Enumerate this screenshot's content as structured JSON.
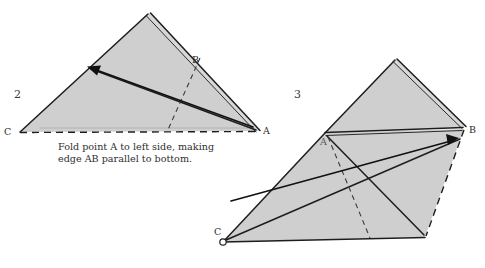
{
  "page": {
    "background_color": "#ffffff",
    "paper_fill_color": "#cfcfcf",
    "line_color": "#1d1d1d"
  },
  "figures": [
    {
      "step_number": "2",
      "caption_line_1": "Fold point A to left side, making",
      "caption_line_2": "edge AB parallel to bottom.",
      "points": [
        {
          "name": "C",
          "label": "C",
          "x": 20,
          "y": 132
        },
        {
          "name": "A",
          "label": "A",
          "x": 258,
          "y": 131
        },
        {
          "name": "B",
          "label": "B",
          "x": 196,
          "y": 60
        }
      ],
      "arrow": {
        "description": "fold arrow from point A to the left edge",
        "from_x": 255,
        "from_y": 128,
        "to_x": 90,
        "to_y": 68
      }
    },
    {
      "step_number": "3",
      "points": [
        {
          "name": "A",
          "label": "A",
          "x": 325,
          "y": 140
        },
        {
          "name": "B",
          "label": "B",
          "x": 470,
          "y": 130
        },
        {
          "name": "C",
          "label": "C",
          "x": 218,
          "y": 232
        }
      ],
      "arrow": {
        "description": "fold arrow from point C toward point B",
        "from_x": 232,
        "from_y": 200,
        "to_x": 456,
        "to_y": 139
      }
    }
  ]
}
